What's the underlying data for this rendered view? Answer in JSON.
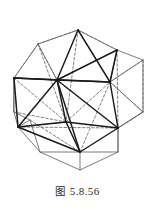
{
  "figure": {
    "caption_label": "图",
    "caption_number": "5.8.56",
    "caption_full": "图 5.8.56",
    "colors": {
      "outline": "#5a5a5a",
      "solid_edge": "#1a1a1a",
      "hidden_edge": "#6b6b6b",
      "background": "#ffffff",
      "caption_text": "#2b2b2b"
    },
    "stroke_widths": {
      "outline": 0.8,
      "solid_edge": 1.5,
      "hidden_edge": 0.8
    },
    "outer_polygon": {
      "name": "dodecahedron-silhouette",
      "points": [
        [
          14,
          78
        ],
        [
          38,
          44
        ],
        [
          78,
          30
        ],
        [
          117,
          50
        ],
        [
          143,
          60
        ],
        [
          143,
          112
        ],
        [
          118,
          128
        ],
        [
          118,
          152
        ],
        [
          80,
          170
        ],
        [
          40,
          152
        ],
        [
          30,
          120
        ],
        [
          14,
          112
        ]
      ]
    },
    "vertices": [
      {
        "name": "top-apex",
        "x": 78,
        "y": 30
      },
      {
        "name": "upper-left",
        "x": 38,
        "y": 44
      },
      {
        "name": "upper-right",
        "x": 117,
        "y": 50
      },
      {
        "name": "left-outer",
        "x": 14,
        "y": 78
      },
      {
        "name": "center-hub",
        "x": 57,
        "y": 80
      },
      {
        "name": "right-mid",
        "x": 110,
        "y": 82
      },
      {
        "name": "far-right",
        "x": 143,
        "y": 60
      },
      {
        "name": "left-lower",
        "x": 14,
        "y": 112
      },
      {
        "name": "lower-left-hub",
        "x": 18,
        "y": 127
      },
      {
        "name": "center-lower",
        "x": 66,
        "y": 122
      },
      {
        "name": "right-lower",
        "x": 118,
        "y": 128
      },
      {
        "name": "bottom-apex",
        "x": 80,
        "y": 152
      },
      {
        "name": "far-right-lower",
        "x": 143,
        "y": 112
      },
      {
        "name": "bottom-dip",
        "x": 80,
        "y": 170
      }
    ],
    "solid_edges": [
      [
        78,
        30,
        57,
        80
      ],
      [
        78,
        30,
        117,
        50
      ],
      [
        78,
        30,
        110,
        82
      ],
      [
        117,
        50,
        110,
        82
      ],
      [
        57,
        80,
        110,
        82
      ],
      [
        57,
        80,
        117,
        50
      ],
      [
        57,
        80,
        18,
        127
      ],
      [
        57,
        80,
        66,
        122
      ],
      [
        57,
        80,
        80,
        152
      ],
      [
        57,
        80,
        118,
        128
      ],
      [
        18,
        127,
        66,
        122
      ],
      [
        18,
        127,
        80,
        152
      ],
      [
        66,
        122,
        80,
        152
      ],
      [
        80,
        152,
        118,
        128
      ],
      [
        110,
        82,
        118,
        128
      ],
      [
        66,
        122,
        118,
        128
      ],
      [
        57,
        80,
        14,
        78
      ],
      [
        57,
        80,
        38,
        44
      ]
    ],
    "hidden_edges": [
      [
        38,
        44,
        78,
        30
      ],
      [
        38,
        44,
        14,
        78
      ],
      [
        14,
        78,
        18,
        127
      ],
      [
        78,
        30,
        66,
        122
      ],
      [
        117,
        50,
        118,
        128
      ],
      [
        14,
        78,
        66,
        122
      ],
      [
        38,
        44,
        66,
        122
      ],
      [
        110,
        82,
        80,
        152
      ],
      [
        18,
        127,
        118,
        128
      ],
      [
        143,
        60,
        110,
        82
      ],
      [
        143,
        112,
        118,
        128
      ],
      [
        110,
        82,
        143,
        112
      ]
    ]
  }
}
